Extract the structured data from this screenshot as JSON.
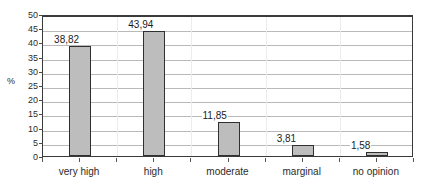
{
  "chart_data": {
    "type": "bar",
    "title": "",
    "subtitle": "",
    "xlabel": "",
    "ylabel": "%",
    "categories": [
      "very high",
      "high",
      "moderate",
      "marginal",
      "no opinion"
    ],
    "values": [
      38.82,
      43.94,
      11.85,
      3.81,
      1.58
    ],
    "value_labels": [
      "38,82",
      "43,94",
      "11,85",
      "3,81",
      "1,58"
    ],
    "series": [
      {
        "name": "",
        "values": [
          38.82,
          43.94,
          11.85,
          3.81,
          1.58
        ]
      }
    ],
    "ylim": [
      0,
      50
    ],
    "ytick_step": 5,
    "ytick_labels": [
      "50",
      "45",
      "40",
      "35",
      "30",
      "25",
      "20",
      "15",
      "10",
      "5",
      "0"
    ],
    "ytick_values": [
      50,
      45,
      40,
      35,
      30,
      25,
      20,
      15,
      10,
      5,
      0
    ],
    "grid": true,
    "grid_orientation": "horizontal",
    "legend": false,
    "legend_position": "none",
    "bar_fill_color": "#bdbdbd",
    "bar_border_color": "#303030",
    "gridline_color": "#b9b9b9",
    "axis_color": "#3a3a3a",
    "background_color": "#ffffff",
    "data_labels_shown": true
  }
}
